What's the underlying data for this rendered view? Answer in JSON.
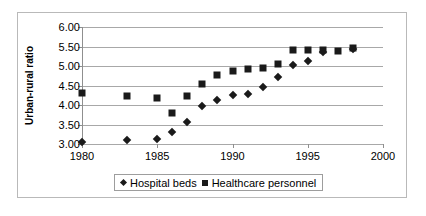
{
  "chart_data": {
    "type": "scatter",
    "title": "",
    "xlabel": "",
    "ylabel": "Urban-rural ratio",
    "xlim": [
      1980,
      2000
    ],
    "ylim": [
      3.0,
      6.0
    ],
    "xticks": [
      "1980",
      "1985",
      "1990",
      "1995",
      "2000"
    ],
    "yticks": [
      "3.00",
      "3.50",
      "4.00",
      "4.50",
      "5.00",
      "5.50",
      "6.00"
    ],
    "grid": true,
    "legend_position": "bottom",
    "series": [
      {
        "name": "Hospital beds",
        "marker": "diamond",
        "color": "#1a1a1a",
        "points": [
          {
            "x": 1980,
            "y": 3.05
          },
          {
            "x": 1983,
            "y": 3.1
          },
          {
            "x": 1985,
            "y": 3.12
          },
          {
            "x": 1986,
            "y": 3.32
          },
          {
            "x": 1987,
            "y": 3.57
          },
          {
            "x": 1988,
            "y": 3.97
          },
          {
            "x": 1989,
            "y": 4.13
          },
          {
            "x": 1990,
            "y": 4.25
          },
          {
            "x": 1991,
            "y": 4.28
          },
          {
            "x": 1992,
            "y": 4.47
          },
          {
            "x": 1993,
            "y": 4.72
          },
          {
            "x": 1994,
            "y": 5.03
          },
          {
            "x": 1995,
            "y": 5.13
          },
          {
            "x": 1996,
            "y": 5.35
          },
          {
            "x": 1998,
            "y": 5.43
          }
        ]
      },
      {
        "name": "Healthcare personnel",
        "marker": "square",
        "color": "#1a1a1a",
        "points": [
          {
            "x": 1980,
            "y": 4.3
          },
          {
            "x": 1983,
            "y": 4.22
          },
          {
            "x": 1985,
            "y": 4.17
          },
          {
            "x": 1986,
            "y": 3.8
          },
          {
            "x": 1987,
            "y": 4.22
          },
          {
            "x": 1988,
            "y": 4.55
          },
          {
            "x": 1989,
            "y": 4.78
          },
          {
            "x": 1990,
            "y": 4.88
          },
          {
            "x": 1991,
            "y": 4.92
          },
          {
            "x": 1992,
            "y": 4.95
          },
          {
            "x": 1993,
            "y": 5.05
          },
          {
            "x": 1994,
            "y": 5.4
          },
          {
            "x": 1995,
            "y": 5.42
          },
          {
            "x": 1996,
            "y": 5.4
          },
          {
            "x": 1997,
            "y": 5.38
          },
          {
            "x": 1998,
            "y": 5.45
          }
        ]
      }
    ],
    "legend": [
      {
        "label": "Hospital beds",
        "marker": "diamond"
      },
      {
        "label": "Healthcare personnel",
        "marker": "square"
      }
    ]
  }
}
